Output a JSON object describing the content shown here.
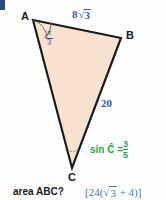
{
  "figure": {
    "shape": "triangle",
    "fill_color": "#fae2d3",
    "stroke_color": "#1b1b1b",
    "background_color": "#fefefe",
    "vertices": [
      {
        "name": "A",
        "label": "A",
        "x": 33,
        "y": 20,
        "label_x": 22,
        "label_y": 13
      },
      {
        "name": "B",
        "label": "B",
        "x": 121,
        "y": 38,
        "label_x": 126,
        "label_y": 32
      },
      {
        "name": "C",
        "label": "C",
        "x": 72,
        "y": 168,
        "label_x": 68,
        "label_y": 172
      }
    ],
    "angle_marker_a": {
      "name": "angle-a",
      "numerator": "π",
      "denominator": "3",
      "color": "#2f4a7c"
    },
    "angle_marker_c": {
      "name": "angle-c",
      "color": "#8a6a55"
    },
    "side_ab": {
      "name": "side-ab",
      "coefficient": "8",
      "radical": "√",
      "radicand": "3",
      "color": "#2f5fa8"
    },
    "side_bc": {
      "name": "side-bc",
      "value": "20",
      "color": "#2f5fa8"
    },
    "given_sin_c": {
      "name": "given-sin-c",
      "prefix": "sin Ĉ =",
      "numerator": "3",
      "denominator": "5",
      "color": "#2f9e52"
    }
  },
  "prompt": {
    "question": "area ABC?",
    "answer": "[24(√3 + 4)]",
    "answer_open": "[24(",
    "answer_radical": "√",
    "answer_radicand": "3",
    "answer_close": " + 4)]",
    "answer_color": "#4a77b8"
  },
  "edge_marker": {
    "name": "page-edge-marker",
    "color": "#2f4a7c"
  }
}
